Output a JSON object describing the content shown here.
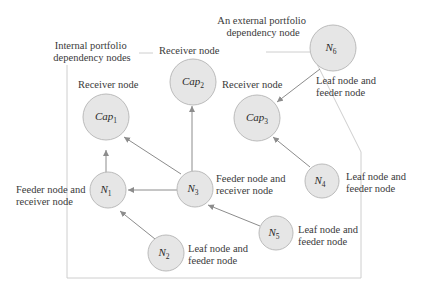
{
  "group_labels": {
    "internal": [
      "Internal portfolio",
      "dependency nodes"
    ],
    "external": [
      "An external portfolio",
      "dependency node"
    ]
  },
  "nodes": [
    {
      "id": "cap1",
      "base": "Cap",
      "sub": "1",
      "role": [
        "Receiver node"
      ]
    },
    {
      "id": "cap2",
      "base": "Cap",
      "sub": "2",
      "role": [
        "Receiver node"
      ]
    },
    {
      "id": "cap3",
      "base": "Cap",
      "sub": "3",
      "role": [
        "Receiver node"
      ]
    },
    {
      "id": "n1",
      "base": "N",
      "sub": "1",
      "role": [
        "Feeder node and",
        "receiver node"
      ]
    },
    {
      "id": "n2",
      "base": "N",
      "sub": "2",
      "role": [
        "Leaf node and",
        "feeder node"
      ]
    },
    {
      "id": "n3",
      "base": "N",
      "sub": "3",
      "role": [
        "Feeder node and",
        "receiver node"
      ]
    },
    {
      "id": "n4",
      "base": "N",
      "sub": "4",
      "role": [
        "Leaf node and",
        "feeder node"
      ]
    },
    {
      "id": "n5",
      "base": "N",
      "sub": "5",
      "role": [
        "Leaf node and",
        "feeder node"
      ]
    },
    {
      "id": "n6",
      "base": "N",
      "sub": "6",
      "role": [
        "Leaf node and",
        "feeder node"
      ]
    }
  ],
  "edges": [
    {
      "from": "n1",
      "to": "cap1"
    },
    {
      "from": "n3",
      "to": "cap1"
    },
    {
      "from": "n3",
      "to": "cap2"
    },
    {
      "from": "n3",
      "to": "n1"
    },
    {
      "from": "n2",
      "to": "n1"
    },
    {
      "from": "n5",
      "to": "n3"
    },
    {
      "from": "n4",
      "to": "cap3"
    },
    {
      "from": "n6",
      "to": "cap3"
    }
  ],
  "colors": {
    "node_fill": "#e6e6e6",
    "node_stroke": "#b4b4b4",
    "edge": "#8c8c8c",
    "boundary": "#c8c8c8",
    "text": "#3a3a3a"
  }
}
